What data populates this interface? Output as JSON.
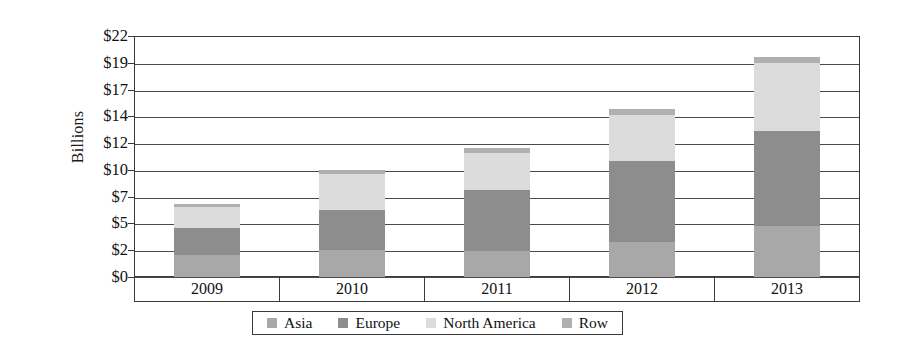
{
  "chart_data": {
    "type": "bar",
    "stacked": true,
    "title": "",
    "xlabel": "",
    "ylabel": "Billions",
    "categories": [
      "2009",
      "2010",
      "2011",
      "2012",
      "2013"
    ],
    "ylim": [
      0,
      22
    ],
    "ytick_values": [
      0,
      2,
      5,
      7,
      10,
      12,
      14,
      17,
      19,
      22
    ],
    "ytick_labels": [
      "$0",
      "$2",
      "$5",
      "$7",
      "$10",
      "$12",
      "$14",
      "$17",
      "$19",
      "$22"
    ],
    "grid": true,
    "legend_position": "bottom",
    "series": [
      {
        "name": "Asia",
        "color": "#a8a8a8",
        "values": [
          2.0,
          2.5,
          2.4,
          3.2,
          4.7
        ]
      },
      {
        "name": "Europe",
        "color": "#8d8d8d",
        "values": [
          2.5,
          3.6,
          5.5,
          7.4,
          8.6
        ]
      },
      {
        "name": "North America",
        "color": "#dcdcdc",
        "values": [
          1.9,
          3.3,
          3.4,
          4.2,
          6.2
        ]
      },
      {
        "name": "Row",
        "color": "#b0b0b0",
        "values": [
          0.3,
          0.4,
          0.5,
          0.5,
          0.6
        ]
      }
    ],
    "totals": [
      6.7,
      9.8,
      11.8,
      15.3,
      20.1
    ]
  },
  "axis": {
    "y_title": "Billions"
  },
  "legend": {
    "items": [
      {
        "label": "Asia",
        "color": "#a8a8a8"
      },
      {
        "label": "Europe",
        "color": "#8d8d8d"
      },
      {
        "label": "North America",
        "color": "#dcdcdc"
      },
      {
        "label": "Row",
        "color": "#b0b0b0"
      }
    ]
  },
  "colors": {
    "axis": "#3a3a3a",
    "grid": "#4a4a4a",
    "background": "#ffffff",
    "text": "#111111"
  }
}
